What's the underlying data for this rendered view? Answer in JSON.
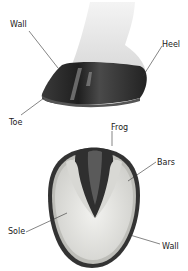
{
  "diagram": {
    "side_view": {
      "labels": [
        {
          "id": "wall",
          "text": "Wall",
          "x": 10,
          "y": 21
        },
        {
          "id": "heel",
          "text": "Heel",
          "x": 162,
          "y": 41
        },
        {
          "id": "toe",
          "text": "Toe",
          "x": 9,
          "y": 119
        }
      ]
    },
    "bottom_view": {
      "labels": [
        {
          "id": "frog",
          "text": "Frog",
          "x": 111,
          "y": 124
        },
        {
          "id": "bars",
          "text": "Bars",
          "x": 157,
          "y": 159
        },
        {
          "id": "sole",
          "text": "Sole",
          "x": 8,
          "y": 228
        },
        {
          "id": "wall",
          "text": "Wall",
          "x": 162,
          "y": 243
        }
      ]
    },
    "colors": {
      "hoof_dark": "#2b2b2b",
      "hair": "#e6e6e6",
      "sole": "#e4e4e0",
      "frog": "#3a3a3a",
      "leader_line": "#333333",
      "label_text": "#1a1a1a"
    }
  }
}
